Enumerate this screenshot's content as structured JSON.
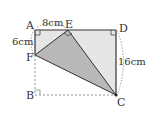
{
  "diagram": {
    "points": {
      "A": {
        "label": "A",
        "x": 35,
        "y": 30
      },
      "B": {
        "label": "B",
        "x": 35,
        "y": 95
      },
      "C": {
        "label": "C",
        "x": 116,
        "y": 95
      },
      "D": {
        "label": "D",
        "x": 116,
        "y": 30
      },
      "E": {
        "label": "E",
        "x": 68,
        "y": 30
      },
      "F": {
        "label": "F",
        "x": 35,
        "y": 55
      }
    },
    "measurements": {
      "AE": "8cm",
      "AF": "6cm",
      "DC": "16cm"
    },
    "colors": {
      "light_fill": "#e6e6e6",
      "dark_fill": "#b8b8b8",
      "stroke": "#333333",
      "dashed": "#777777"
    }
  }
}
